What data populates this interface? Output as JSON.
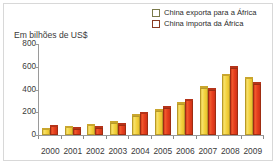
{
  "chart_data": {
    "type": "bar",
    "title": "Em bilhões de US$",
    "subtitle": "",
    "xlabel": "",
    "ylabel": "Em bilhões de US$",
    "categories": [
      "2000",
      "2001",
      "2002",
      "2003",
      "2004",
      "2005",
      "2006",
      "2007",
      "2008",
      "2009"
    ],
    "series": [
      {
        "name": "China exporta para a África",
        "color": "#f4d542",
        "values": [
          50,
          70,
          85,
          110,
          170,
          215,
          275,
          415,
          525,
          500
        ]
      },
      {
        "name": "China importa da África",
        "color": "#e8401f",
        "values": [
          75,
          55,
          65,
          90,
          190,
          240,
          305,
          400,
          590,
          450
        ]
      }
    ],
    "yticks": [
      0,
      200,
      400,
      600,
      800
    ],
    "ytick_labels": [
      "0",
      "200",
      "400",
      "600",
      "800"
    ],
    "ylim": [
      0,
      800
    ],
    "grid": false,
    "legend_position": "top-right"
  },
  "legend": {
    "items": [
      {
        "label": "China exporta para a África",
        "color": "#f4d542",
        "swatch": "yellow-swatch"
      },
      {
        "label": "China importa da África",
        "color": "#e8401f",
        "swatch": "red-swatch"
      }
    ]
  },
  "axis": {
    "title": "Em bilhões de US$"
  },
  "colors": {
    "export": "#f4d542",
    "import": "#e8401f",
    "axis": "#9a9a9a",
    "text": "#3a3a3a",
    "border": "#d8d8d8",
    "background": "#ffffff"
  }
}
